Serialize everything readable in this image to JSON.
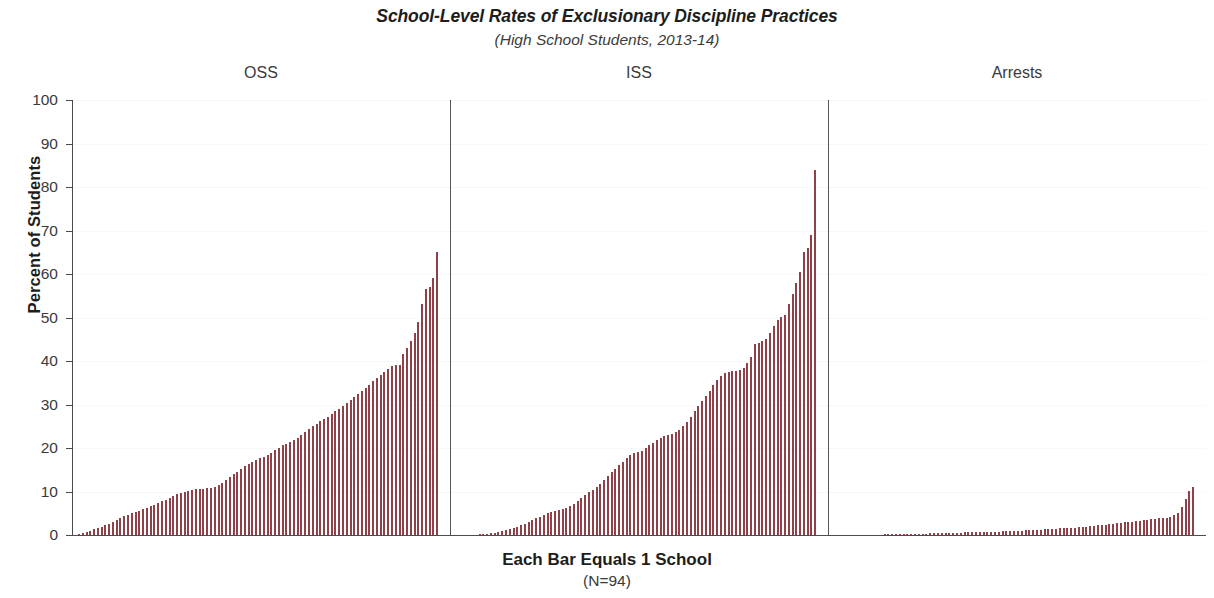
{
  "chart_data": {
    "type": "bar",
    "title": "School-Level Rates of Exclusionary Discipline Practices",
    "subtitle": "(High School Students, 2013-14)",
    "xlabel": "Each Bar Equals 1 School",
    "xlabel_sub": "(N=94)",
    "ylabel": "Percent of Students",
    "ylim": [
      0,
      100
    ],
    "ytick_labels": [
      "0",
      "10",
      "20",
      "30",
      "40",
      "50",
      "60",
      "70",
      "80",
      "90",
      "100"
    ],
    "ytick_values": [
      0,
      10,
      20,
      30,
      40,
      50,
      60,
      70,
      80,
      90,
      100
    ],
    "grid": false,
    "legend": "none",
    "n_schools": 94,
    "bar_color": "#bb6b71",
    "bar_edge_color": "#8e4148",
    "axis_color": "#4a4a4a",
    "note": "Each panel shows 94 high schools sorted ascending by rate; one bar per school.",
    "panels": [
      {
        "label": "OSS",
        "name": "out-of-school-suspension",
        "values": [
          0.3,
          0.5,
          0.8,
          1.0,
          1.3,
          1.6,
          1.9,
          2.2,
          2.6,
          3.0,
          3.4,
          3.8,
          4.3,
          4.7,
          5.0,
          5.3,
          5.6,
          6.0,
          6.3,
          6.6,
          7.0,
          7.4,
          7.8,
          8.1,
          8.5,
          9.0,
          9.4,
          9.7,
          10.0,
          10.2,
          10.4,
          10.5,
          10.6,
          10.6,
          10.7,
          10.8,
          11.0,
          11.4,
          12.0,
          12.7,
          13.4,
          14.0,
          14.6,
          15.2,
          15.8,
          16.3,
          16.8,
          17.2,
          17.6,
          18.0,
          18.4,
          18.9,
          19.5,
          20.1,
          20.6,
          21.0,
          21.4,
          21.8,
          22.3,
          22.9,
          23.6,
          24.3,
          25.0,
          25.6,
          26.1,
          26.6,
          27.2,
          27.8,
          28.4,
          29.0,
          29.6,
          30.3,
          31.0,
          31.7,
          32.4,
          33.1,
          33.9,
          34.6,
          35.3,
          36.0,
          36.7,
          37.5,
          38.2,
          38.8,
          39.0,
          39.1,
          41.5,
          43.0,
          44.5,
          46.5,
          49.0,
          53.0,
          56.5,
          57.0,
          59.0,
          65.0
        ]
      },
      {
        "label": "ISS",
        "name": "in-school-suspension",
        "values": [
          0.0,
          0.0,
          0.0,
          0.0,
          0.0,
          0.0,
          0.1,
          0.2,
          0.3,
          0.4,
          0.5,
          0.7,
          0.9,
          1.1,
          1.3,
          1.6,
          1.9,
          2.2,
          2.6,
          3.0,
          3.4,
          3.8,
          4.2,
          4.6,
          5.0,
          5.4,
          5.6,
          5.8,
          6.0,
          6.2,
          6.6,
          7.2,
          7.9,
          8.6,
          9.2,
          9.8,
          10.4,
          11.0,
          11.8,
          12.6,
          13.5,
          14.4,
          15.2,
          16.0,
          16.8,
          17.6,
          18.4,
          18.8,
          19.0,
          19.4,
          20.0,
          20.6,
          21.2,
          21.8,
          22.4,
          22.8,
          23.0,
          23.2,
          23.6,
          24.2,
          25.0,
          26.0,
          27.2,
          28.4,
          29.6,
          30.8,
          32.0,
          33.2,
          34.4,
          35.6,
          36.6,
          37.2,
          37.4,
          37.6,
          37.8,
          38.0,
          38.4,
          39.6,
          41.0,
          43.8,
          44.2,
          44.6,
          45.0,
          46.5,
          48.0,
          49.5,
          50.2,
          50.6,
          53.0,
          55.5,
          58.0,
          60.5,
          65.0,
          66.0,
          69.0,
          84.0
        ]
      },
      {
        "label": "Arrests",
        "name": "school-based-arrests",
        "values": [
          0.0,
          0.0,
          0.0,
          0.0,
          0.0,
          0.0,
          0.0,
          0.0,
          0.0,
          0.0,
          0.0,
          0.0,
          0.0,
          0.05,
          0.1,
          0.12,
          0.15,
          0.18,
          0.2,
          0.22,
          0.25,
          0.28,
          0.3,
          0.32,
          0.34,
          0.36,
          0.38,
          0.4,
          0.42,
          0.45,
          0.48,
          0.5,
          0.52,
          0.55,
          0.58,
          0.6,
          0.62,
          0.65,
          0.68,
          0.7,
          0.72,
          0.75,
          0.78,
          0.8,
          0.85,
          0.88,
          0.9,
          0.92,
          0.95,
          1.0,
          1.05,
          1.1,
          1.15,
          1.2,
          1.25,
          1.3,
          1.35,
          1.4,
          1.45,
          1.5,
          1.55,
          1.6,
          1.65,
          1.7,
          1.8,
          1.9,
          1.95,
          2.0,
          2.1,
          2.2,
          2.3,
          2.4,
          2.5,
          2.6,
          2.7,
          2.8,
          2.9,
          3.0,
          3.1,
          3.2,
          3.3,
          3.4,
          3.5,
          3.6,
          3.7,
          3.8,
          3.9,
          4.0,
          4.2,
          4.5,
          5.0,
          6.5,
          8.2,
          10.2,
          11.0
        ]
      }
    ]
  }
}
